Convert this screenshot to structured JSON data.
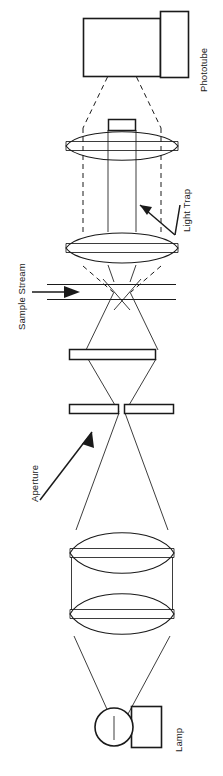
{
  "figure": {
    "orientation": "rotated-90",
    "background_color": "#ffffff",
    "line_color": "#1a1a1a"
  },
  "labels": {
    "phototube": "Phototube",
    "light_trap": "Light Trap",
    "sample_stream": "Sample Stream",
    "aperture": "Aperture",
    "lamp": "Lamp"
  },
  "components": [
    {
      "name": "phototube-housing",
      "label": "Phototube",
      "kind": "rectangle"
    },
    {
      "name": "phototube-base",
      "label": "Phototube",
      "kind": "rectangle"
    },
    {
      "name": "light-trap-block",
      "label": "Light Trap",
      "kind": "rectangle"
    },
    {
      "name": "collection-lens-upper",
      "label": "",
      "kind": "biconvex-lens"
    },
    {
      "name": "collection-lens-lower",
      "label": "",
      "kind": "biconvex-lens"
    },
    {
      "name": "flow-cell",
      "label": "Sample Stream",
      "kind": "stream-lines"
    },
    {
      "name": "field-stop",
      "label": "",
      "kind": "aperture-bar"
    },
    {
      "name": "aperture-stop",
      "label": "Aperture",
      "kind": "aperture-bar"
    },
    {
      "name": "condenser-lens-upper",
      "label": "",
      "kind": "biconvex-lens"
    },
    {
      "name": "condenser-lens-lower",
      "label": "",
      "kind": "biconvex-lens"
    },
    {
      "name": "lamp-envelope",
      "label": "Lamp",
      "kind": "circle"
    },
    {
      "name": "lamp-base",
      "label": "Lamp",
      "kind": "rectangle"
    }
  ]
}
